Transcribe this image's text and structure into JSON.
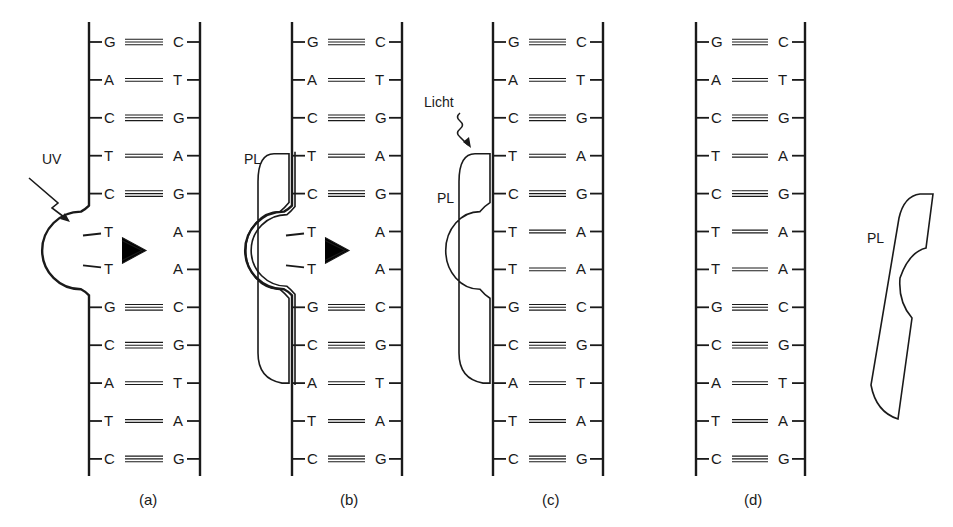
{
  "figure": {
    "colors": {
      "ink": "#1a1a1a",
      "background": "#ffffff"
    },
    "base_pairs": [
      {
        "left": "G",
        "right": "C",
        "bonds": 3
      },
      {
        "left": "A",
        "right": "T",
        "bonds": 2
      },
      {
        "left": "C",
        "right": "G",
        "bonds": 3
      },
      {
        "left": "T",
        "right": "A",
        "bonds": 2
      },
      {
        "left": "C",
        "right": "G",
        "bonds": 3
      },
      {
        "left": "T",
        "right": "A",
        "bonds": 2
      },
      {
        "left": "T",
        "right": "A",
        "bonds": 2
      },
      {
        "left": "G",
        "right": "C",
        "bonds": 3
      },
      {
        "left": "C",
        "right": "G",
        "bonds": 3
      },
      {
        "left": "A",
        "right": "T",
        "bonds": 2
      },
      {
        "left": "T",
        "right": "A",
        "bonds": 2
      },
      {
        "left": "C",
        "right": "G",
        "bonds": 3
      }
    ],
    "panels": [
      {
        "id": "a",
        "label": "(a)",
        "left_x": 89,
        "right_x": 200,
        "dimer": true,
        "enzyme": "none",
        "annotation": "UV"
      },
      {
        "id": "b",
        "label": "(b)",
        "left_x": 292,
        "right_x": 402,
        "dimer": true,
        "enzyme": "bound",
        "annotation": "PL"
      },
      {
        "id": "c",
        "label": "(c)",
        "left_x": 493,
        "right_x": 603,
        "dimer": false,
        "enzyme": "bound",
        "annotation": "Licht",
        "enzyme_label": "PL"
      },
      {
        "id": "d",
        "label": "(d)",
        "left_x": 696,
        "right_x": 805,
        "dimer": false,
        "enzyme": "released",
        "annotation": "PL"
      }
    ],
    "labels": {
      "uv": "UV",
      "light": "Licht",
      "photolyase": "PL",
      "panel_a": "(a)",
      "panel_b": "(b)",
      "panel_c": "(c)",
      "panel_d": "(d)"
    }
  }
}
